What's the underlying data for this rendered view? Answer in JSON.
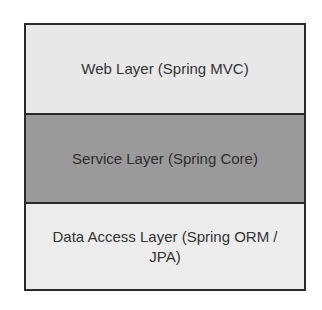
{
  "diagram": {
    "layers": [
      {
        "label": "Web Layer (Spring MVC)",
        "fill": "#e8e8e8"
      },
      {
        "label": "Service Layer (Spring Core)",
        "fill": "#9a9a9a"
      },
      {
        "label": "Data Access Layer (Spring ORM / JPA)",
        "fill": "#ececec"
      }
    ]
  }
}
